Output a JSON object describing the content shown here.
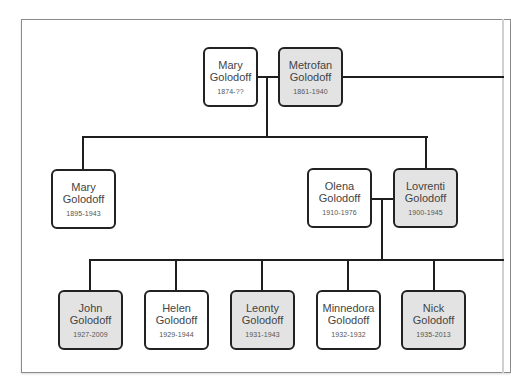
{
  "tree": {
    "generation1": [
      {
        "first": "Mary",
        "last": "Golodoff",
        "dates": "1874-??",
        "sex": "female"
      },
      {
        "first": "Metrofan",
        "last": "Golodoff",
        "dates": "1861-1940",
        "sex": "male"
      }
    ],
    "generation2": [
      {
        "first": "Mary",
        "last": "Golodoff",
        "dates": "1895-1943",
        "sex": "female"
      },
      {
        "first": "Olena",
        "last": "Golodoff",
        "dates": "1910-1976",
        "sex": "female"
      },
      {
        "first": "Lovrenti",
        "last": "Golodoff",
        "dates": "1900-1945",
        "sex": "male"
      }
    ],
    "generation3": [
      {
        "first": "John",
        "last": "Golodoff",
        "dates": "1927-2009",
        "sex": "male"
      },
      {
        "first": "Helen",
        "last": "Golodoff",
        "dates": "1929-1944",
        "sex": "female"
      },
      {
        "first": "Leonty",
        "last": "Golodoff",
        "dates": "1931-1943",
        "sex": "male"
      },
      {
        "first": "Minnedora",
        "last": "Golodoff",
        "dates": "1932-1932",
        "sex": "female"
      },
      {
        "first": "Nick",
        "last": "Golodoff",
        "dates": "1935-2013",
        "sex": "male"
      }
    ]
  },
  "colors": {
    "male_fill": "#e3e3e3",
    "female_fill": "#ffffff",
    "border": "#222222",
    "connector": "#1e1e1e"
  }
}
